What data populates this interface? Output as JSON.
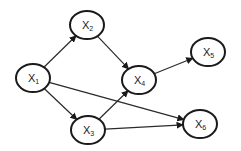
{
  "diagram": {
    "type": "directed-graph",
    "nodes": [
      {
        "id": "X1",
        "base": "X",
        "sub": "1",
        "cx": 33,
        "cy": 78
      },
      {
        "id": "X2",
        "base": "X",
        "sub": "2",
        "cx": 87,
        "cy": 25
      },
      {
        "id": "X3",
        "base": "X",
        "sub": "3",
        "cx": 88,
        "cy": 130
      },
      {
        "id": "X4",
        "base": "X",
        "sub": "4",
        "cx": 139,
        "cy": 80
      },
      {
        "id": "X5",
        "base": "X",
        "sub": "5",
        "cx": 208,
        "cy": 52
      },
      {
        "id": "X6",
        "base": "X",
        "sub": "6",
        "cx": 200,
        "cy": 124
      }
    ],
    "edges": [
      {
        "from": "X1",
        "to": "X2"
      },
      {
        "from": "X1",
        "to": "X3"
      },
      {
        "from": "X1",
        "to": "X6"
      },
      {
        "from": "X2",
        "to": "X4"
      },
      {
        "from": "X3",
        "to": "X4"
      },
      {
        "from": "X3",
        "to": "X6"
      },
      {
        "from": "X4",
        "to": "X5"
      }
    ],
    "node_rx": 17,
    "node_ry": 14,
    "colors": {
      "stroke": "#1a1a1a",
      "fill": "#ffffff",
      "edge": "#2a2a2a"
    }
  }
}
